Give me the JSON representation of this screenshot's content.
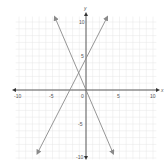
{
  "chart_data": {
    "type": "line",
    "title": "",
    "xlabel": "x",
    "ylabel": "y",
    "xlim": [
      -11,
      11
    ],
    "ylim": [
      -11,
      11
    ],
    "grid": true,
    "x_ticks": [
      "-10",
      "-5",
      "0",
      "5",
      "10"
    ],
    "y_ticks": [
      "10",
      "5",
      "-5",
      "-10"
    ],
    "series": [
      {
        "name": "line-rising",
        "equation": "y = 2x + 4",
        "x": [
          -7.5,
          3.5
        ],
        "y": [
          -11,
          11
        ]
      },
      {
        "name": "line-falling",
        "equation": "y = -2x - 1",
        "x": [
          -5,
          5
        ],
        "y": [
          9,
          -11
        ]
      }
    ],
    "intersection": {
      "x": -1.25,
      "y": 1.5
    }
  },
  "labels": {
    "x_axis": "x",
    "y_axis": "y",
    "x_neg10": "-10",
    "x_neg5": "-5",
    "x_0": "0",
    "x_5": "5",
    "x_10": "10",
    "y_10": "10",
    "y_5": "5",
    "y_neg5": "-5",
    "y_neg10": "-10"
  },
  "colors": {
    "line": "#8a8a8a",
    "axis": "#333333",
    "grid": "#e6e6e6"
  }
}
